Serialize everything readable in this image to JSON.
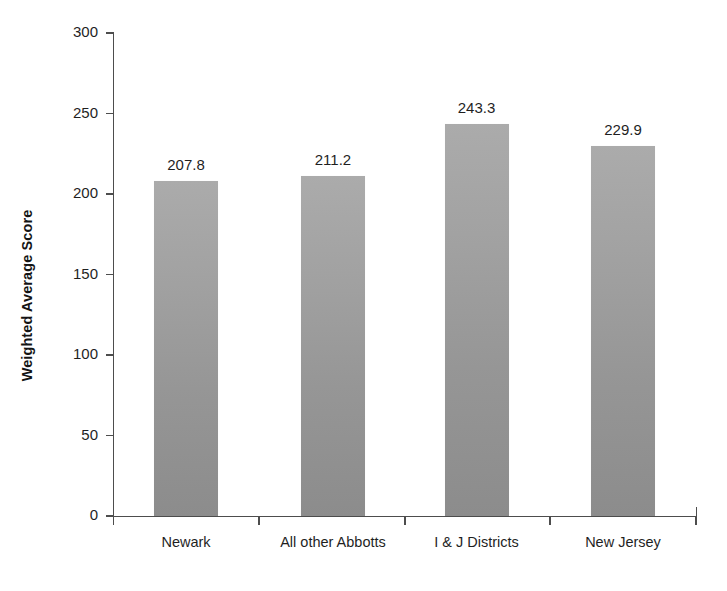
{
  "chart_data": {
    "type": "bar",
    "title": "",
    "subtitle": "",
    "xlabel": "",
    "ylabel": "Weighted Average Score",
    "categories": [
      "Newark",
      "All other Abbotts",
      "I & J Districts",
      "New Jersey"
    ],
    "values": [
      207.8,
      211.2,
      243.3,
      229.9
    ],
    "value_labels": [
      "207.8",
      "211.2",
      "243.3",
      "229.9"
    ],
    "ylim": [
      0,
      300
    ],
    "ytick_values": [
      0,
      50,
      100,
      150,
      200,
      250,
      300
    ],
    "ytick_labels": [
      "0",
      "50",
      "100",
      "150",
      "200",
      "250",
      "300"
    ],
    "grid": false,
    "legend": false,
    "legend_position": "none",
    "series": [
      {
        "name": "Weighted Average Score",
        "values": [
          207.8,
          211.2,
          243.3,
          229.9
        ],
        "color": "#999999"
      }
    ],
    "bar_color": "#999999",
    "axis_color": "#4d4d4d",
    "text_color": "#1f1f1f",
    "background_color": "#ffffff"
  },
  "axis": {
    "y_title": "Weighted Average Score"
  }
}
